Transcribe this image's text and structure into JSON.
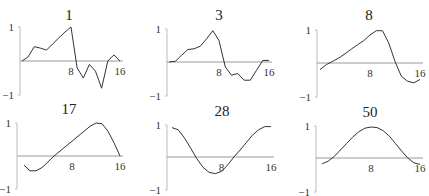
{
  "figure": {
    "panel_titles": [
      "1",
      "3",
      "8",
      "17",
      "28",
      "50"
    ],
    "tick_labels": {
      "y_top": "1",
      "y_bottom": "−1",
      "x_mid": "8",
      "x_end": "16"
    }
  },
  "chart_data": [
    {
      "type": "line",
      "title": "1",
      "x": [
        0,
        1,
        2,
        3,
        4,
        5,
        6,
        7,
        8,
        9,
        10,
        11,
        12,
        13,
        14,
        15,
        16
      ],
      "values": [
        0,
        0.12,
        0.42,
        0.38,
        0.32,
        0.5,
        0.68,
        0.85,
        1.0,
        -0.2,
        -0.5,
        -0.1,
        -0.3,
        -0.8,
        0.0,
        0.18,
        0.0
      ],
      "xlabel": "",
      "ylabel": "",
      "xticks": [
        8,
        16
      ],
      "yticks": [
        -1,
        1
      ],
      "ylim": [
        -1,
        1
      ],
      "xlim": [
        0,
        16
      ],
      "grid": false
    },
    {
      "type": "line",
      "title": "3",
      "x": [
        0,
        1,
        2,
        3,
        4,
        5,
        6,
        7,
        8,
        9,
        10,
        11,
        12,
        13,
        14,
        15,
        16
      ],
      "values": [
        0,
        0.02,
        0.2,
        0.38,
        0.4,
        0.48,
        0.7,
        0.95,
        0.65,
        -0.15,
        -0.4,
        -0.35,
        -0.55,
        -0.55,
        -0.25,
        0.05,
        0.05
      ],
      "xlabel": "",
      "ylabel": "",
      "xticks": [
        8,
        16
      ],
      "yticks": [
        -1,
        1
      ],
      "ylim": [
        -1,
        1
      ],
      "xlim": [
        0,
        16
      ],
      "grid": false
    },
    {
      "type": "line",
      "title": "8",
      "x": [
        0,
        1,
        2,
        3,
        4,
        5,
        6,
        7,
        8,
        9,
        10,
        11,
        12,
        13,
        14,
        15,
        16
      ],
      "values": [
        -0.2,
        -0.05,
        0.05,
        0.15,
        0.28,
        0.42,
        0.55,
        0.68,
        0.85,
        0.98,
        0.98,
        0.6,
        0.05,
        -0.4,
        -0.55,
        -0.6,
        -0.5
      ],
      "xlabel": "",
      "ylabel": "",
      "xticks": [
        8,
        16
      ],
      "yticks": [
        -1,
        1
      ],
      "ylim": [
        -1,
        1
      ],
      "xlim": [
        0,
        16
      ],
      "grid": false
    },
    {
      "type": "line",
      "title": "17",
      "x": [
        0,
        1,
        2,
        3,
        4,
        5,
        6,
        7,
        8,
        9,
        10,
        11,
        12,
        13,
        14,
        15,
        16
      ],
      "values": [
        -0.28,
        -0.45,
        -0.45,
        -0.35,
        -0.18,
        0.0,
        0.15,
        0.3,
        0.45,
        0.6,
        0.75,
        0.9,
        1.0,
        0.98,
        0.75,
        0.4,
        0.0
      ],
      "xlabel": "",
      "ylabel": "",
      "xticks": [
        8,
        16
      ],
      "yticks": [
        -1,
        1
      ],
      "ylim": [
        -1,
        1
      ],
      "xlim": [
        0,
        16
      ],
      "grid": false
    },
    {
      "type": "line",
      "title": "28",
      "x": [
        0,
        1,
        2,
        3,
        4,
        5,
        6,
        7,
        8,
        9,
        10,
        11,
        12,
        13,
        14,
        15,
        16
      ],
      "values": [
        0.92,
        0.85,
        0.6,
        0.28,
        -0.05,
        -0.32,
        -0.48,
        -0.52,
        -0.45,
        -0.25,
        0.0,
        0.22,
        0.45,
        0.68,
        0.85,
        0.95,
        0.95
      ],
      "xlabel": "",
      "ylabel": "",
      "xticks": [
        8,
        16
      ],
      "yticks": [
        -1,
        1
      ],
      "ylim": [
        -1,
        1
      ],
      "xlim": [
        0,
        16
      ],
      "grid": false
    },
    {
      "type": "line",
      "title": "50",
      "x": [
        0,
        1,
        2,
        3,
        4,
        5,
        6,
        7,
        8,
        9,
        10,
        11,
        12,
        13,
        14,
        15,
        16
      ],
      "values": [
        -0.18,
        -0.1,
        0.05,
        0.25,
        0.45,
        0.65,
        0.82,
        0.93,
        0.97,
        0.95,
        0.85,
        0.68,
        0.45,
        0.22,
        0.0,
        -0.15,
        -0.2
      ],
      "xlabel": "",
      "ylabel": "",
      "xticks": [
        8,
        16
      ],
      "yticks": [
        -1,
        1
      ],
      "ylim": [
        -1,
        1
      ],
      "xlim": [
        0,
        16
      ],
      "grid": false
    }
  ],
  "layout": [
    {
      "ax_x": 20,
      "x0": 22,
      "x16": 120,
      "y1": 27,
      "y0": 61,
      "ym1": 95,
      "tx": 69,
      "ty": 20
    },
    {
      "ax_x": 167,
      "x0": 169,
      "x16": 269,
      "y1": 29,
      "y0": 62,
      "ym1": 96,
      "tx": 219,
      "ty": 20
    },
    {
      "ax_x": 317,
      "x0": 320,
      "x16": 420,
      "y1": 30,
      "y0": 63,
      "ym1": 97,
      "tx": 369,
      "ty": 20
    },
    {
      "ax_x": 17,
      "x0": 24,
      "x16": 120,
      "y1": 123,
      "y0": 156,
      "ym1": 189,
      "tx": 69,
      "ty": 114
    },
    {
      "ax_x": 167,
      "x0": 172,
      "x16": 271,
      "y1": 125,
      "y0": 157,
      "ym1": 190,
      "tx": 222,
      "ty": 116
    },
    {
      "ax_x": 316,
      "x0": 322,
      "x16": 420,
      "y1": 126,
      "y0": 158,
      "ym1": 192,
      "tx": 370,
      "ty": 117
    }
  ]
}
